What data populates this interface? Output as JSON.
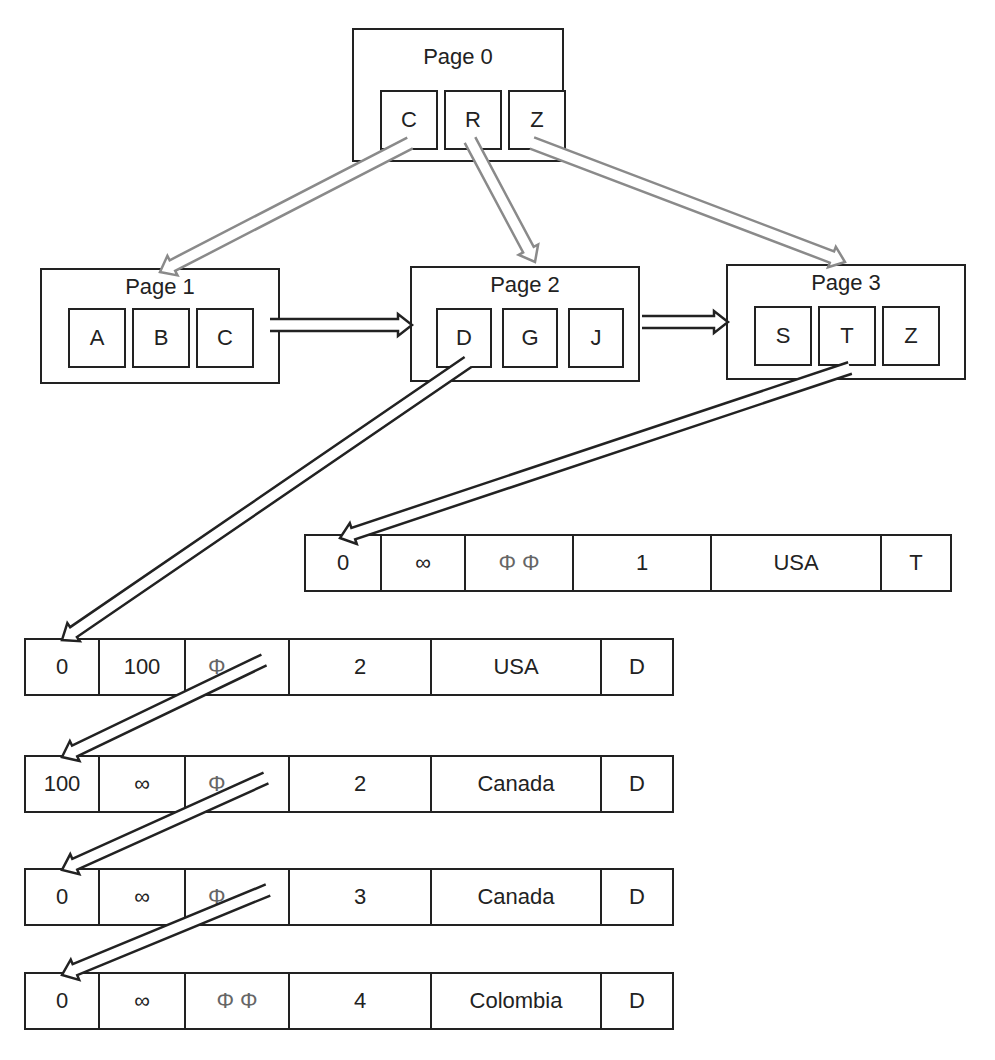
{
  "diagram": {
    "type": "B+ tree index with leaf pages pointing to record chains",
    "root": {
      "title": "Page 0",
      "keys": [
        "C",
        "R",
        "Z"
      ]
    },
    "leaves": [
      {
        "title": "Page 1",
        "keys": [
          "A",
          "B",
          "C"
        ]
      },
      {
        "title": "Page 2",
        "keys": [
          "D",
          "G",
          "J"
        ]
      },
      {
        "title": "Page 3",
        "keys": [
          "S",
          "T",
          "Z"
        ]
      }
    ],
    "records": [
      {
        "id": "rec-t-1",
        "cells": [
          "0",
          "∞",
          "Φ  Φ",
          "1",
          "USA",
          "T"
        ]
      },
      {
        "id": "rec-d-1",
        "cells": [
          "0",
          "100",
          "Φ",
          "2",
          "USA",
          "D"
        ]
      },
      {
        "id": "rec-d-2",
        "cells": [
          "100",
          "∞",
          "Φ",
          "2",
          "Canada",
          "D"
        ]
      },
      {
        "id": "rec-d-3",
        "cells": [
          "0",
          "∞",
          "Φ",
          "3",
          "Canada",
          "D"
        ]
      },
      {
        "id": "rec-d-4",
        "cells": [
          "0",
          "∞",
          "Φ  Φ",
          "4",
          "Colombia",
          "D"
        ]
      }
    ],
    "edges": [
      {
        "from": "Page 0 / C",
        "to": "Page 1",
        "style": "gray-hollow"
      },
      {
        "from": "Page 0 / R",
        "to": "Page 2",
        "style": "gray-hollow"
      },
      {
        "from": "Page 0 / Z",
        "to": "Page 3",
        "style": "gray-hollow"
      },
      {
        "from": "Page 1",
        "to": "Page 2",
        "style": "black-hollow"
      },
      {
        "from": "Page 2",
        "to": "Page 3",
        "style": "black-hollow"
      },
      {
        "from": "Page 2 / D",
        "to": "rec-d-1",
        "style": "black-hollow"
      },
      {
        "from": "Page 3 / T",
        "to": "rec-t-1",
        "style": "black-hollow"
      },
      {
        "from": "rec-d-1",
        "to": "rec-d-2",
        "style": "black-hollow"
      },
      {
        "from": "rec-d-2",
        "to": "rec-d-3",
        "style": "black-hollow"
      },
      {
        "from": "rec-d-3",
        "to": "rec-d-4",
        "style": "black-hollow"
      }
    ]
  },
  "colors": {
    "line": "#222222",
    "gray_arrow": "#8a8a8a",
    "phi": "#666666",
    "background": "#ffffff"
  }
}
